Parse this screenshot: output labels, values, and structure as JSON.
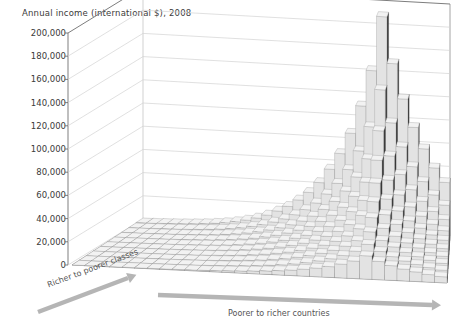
{
  "chart": {
    "title": "Annual income (international $), 2008",
    "axis_left_label": "Richer to poorer classes",
    "axis_bottom_label": "Poorer to richer countries"
  },
  "chart_data": {
    "type": "bar",
    "title": "Annual income (international $), 2008",
    "subtitle": "",
    "xlabel": "Poorer to richer countries",
    "ylabel": "Annual income (international $)",
    "zlabel": "Richer to poorer classes",
    "grid": true,
    "legend": null,
    "ylim": [
      0,
      200000
    ],
    "ytick_labels": [
      "200,000",
      "180,000",
      "160,000",
      "140,000",
      "120,000",
      "100,000",
      "80,000",
      "60,000",
      "40,000",
      "20,000",
      "0"
    ],
    "ytick_values": [
      200000,
      180000,
      160000,
      140000,
      120000,
      100000,
      80000,
      60000,
      40000,
      20000,
      0
    ],
    "x_categories": [
      "c01",
      "c02",
      "c03",
      "c04",
      "c05",
      "c06",
      "c07",
      "c08",
      "c09",
      "c10",
      "c11",
      "c12",
      "c13",
      "c14",
      "c15",
      "c16",
      "c17",
      "c18",
      "c19",
      "c20",
      "c21",
      "c22",
      "c23",
      "c24",
      "c25",
      "c26",
      "c27",
      "c28",
      "c29",
      "c30"
    ],
    "z_categories": [
      "class1-richest",
      "class2",
      "class3",
      "class4",
      "class5",
      "class6",
      "class7",
      "class8",
      "class9",
      "class10-poorest"
    ],
    "note": "3D skyline surface: each x is a country ordered poorer to richer; each z row is an income class ordered richest (back) to poorest (front). Values are annual income in international dollars.",
    "series": [
      {
        "name": "class1-richest",
        "values": [
          900,
          1100,
          1400,
          1700,
          2100,
          2600,
          3200,
          4000,
          5000,
          6400,
          8200,
          10500,
          13500,
          17500,
          22000,
          28000,
          35000,
          44000,
          56000,
          70000,
          88000,
          112000,
          143000,
          190000,
          150000,
          120000,
          96000,
          78000,
          62000,
          50000
        ]
      },
      {
        "name": "class2",
        "values": [
          620,
          760,
          960,
          1180,
          1450,
          1800,
          2200,
          2750,
          3450,
          4400,
          5650,
          7250,
          9300,
          12000,
          15200,
          19300,
          24200,
          30400,
          38600,
          48300,
          60700,
          77300,
          98600,
          131000,
          103000,
          82800,
          66200,
          53800,
          42800,
          34500
        ]
      },
      {
        "name": "class3",
        "values": [
          470,
          580,
          730,
          900,
          1100,
          1370,
          1680,
          2090,
          2630,
          3350,
          4300,
          5520,
          7080,
          9140,
          11600,
          14700,
          18400,
          23100,
          29400,
          36800,
          46200,
          58800,
          75000,
          99700,
          78500,
          63000,
          50400,
          40900,
          32600,
          26200
        ]
      },
      {
        "name": "class4",
        "values": [
          370,
          455,
          575,
          705,
          865,
          1070,
          1320,
          1640,
          2070,
          2630,
          3380,
          4340,
          5560,
          7180,
          9100,
          11500,
          14500,
          18200,
          23100,
          28900,
          36300,
          46200,
          58900,
          78300,
          61700,
          49500,
          39600,
          32100,
          25600,
          20600
        ]
      },
      {
        "name": "class5",
        "values": [
          300,
          365,
          460,
          565,
          695,
          860,
          1060,
          1320,
          1660,
          2110,
          2710,
          3480,
          4460,
          5760,
          7300,
          9270,
          11600,
          14600,
          18500,
          23200,
          29100,
          37000,
          47200,
          62800,
          49400,
          39700,
          31700,
          25800,
          20500,
          16500
        ]
      },
      {
        "name": "class6",
        "values": [
          240,
          295,
          373,
          458,
          562,
          696,
          857,
          1070,
          1340,
          1710,
          2190,
          2810,
          3610,
          4660,
          5900,
          7490,
          9390,
          11800,
          15000,
          18700,
          23500,
          29900,
          38200,
          50700,
          40000,
          32100,
          25600,
          20800,
          16600,
          13300
        ]
      },
      {
        "name": "class7",
        "values": [
          194,
          238,
          301,
          369,
          453,
          561,
          691,
          861,
          1080,
          1380,
          1770,
          2270,
          2910,
          3760,
          4760,
          6040,
          7570,
          9520,
          12100,
          15100,
          19000,
          24100,
          30800,
          40900,
          32200,
          25900,
          20700,
          16800,
          13400,
          10700
        ]
      },
      {
        "name": "class8",
        "values": [
          155,
          190,
          240,
          295,
          362,
          449,
          553,
          689,
          867,
          1100,
          1410,
          1810,
          2330,
          3010,
          3810,
          4830,
          6060,
          7620,
          9660,
          12100,
          15200,
          19300,
          24600,
          32700,
          25800,
          20700,
          16500,
          13400,
          10700,
          8600
        ]
      },
      {
        "name": "class9",
        "values": [
          122,
          150,
          190,
          233,
          286,
          354,
          437,
          544,
          685,
          872,
          1120,
          1430,
          1840,
          2380,
          3010,
          3820,
          4790,
          6020,
          7630,
          9560,
          12000,
          15300,
          19500,
          25900,
          20400,
          16400,
          13100,
          10600,
          8450,
          6800
        ]
      },
      {
        "name": "class10-poorest",
        "values": [
          95,
          117,
          148,
          181,
          223,
          276,
          340,
          424,
          533,
          679,
          870,
          1120,
          1430,
          1850,
          2340,
          2970,
          3730,
          4690,
          5940,
          7440,
          9340,
          11900,
          15100,
          20100,
          15800,
          12700,
          10200,
          8250,
          6580,
          5290
        ]
      }
    ]
  }
}
